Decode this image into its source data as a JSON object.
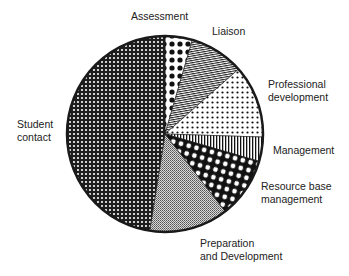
{
  "chart_data": {
    "type": "pie",
    "title": "",
    "start_angle_deg": 0,
    "direction": "clockwise",
    "categories": [
      "Assessment",
      "Liaison",
      "Professional development",
      "Management",
      "Resource base management",
      "Preparation and Development",
      "Student contact"
    ],
    "values": [
      4.5,
      9,
      12,
      4,
      10,
      13,
      47.5
    ],
    "unit": "percent (estimated)",
    "slices": [
      {
        "name": "Assessment",
        "value": 4.5,
        "pattern": "large-black-dots-on-white"
      },
      {
        "name": "Liaison",
        "value": 9,
        "pattern": "fine-diagonal-lines"
      },
      {
        "name": "Professional development",
        "value": 12,
        "pattern": "small-black-dots-on-white"
      },
      {
        "name": "Management",
        "value": 4,
        "pattern": "vertical-stripes"
      },
      {
        "name": "Resource base management",
        "value": 10,
        "pattern": "white-dots-on-black"
      },
      {
        "name": "Preparation and Development",
        "value": 13,
        "pattern": "fine-crosshatch-grey"
      },
      {
        "name": "Student contact",
        "value": 47.5,
        "pattern": "dense-checker-dark"
      }
    ],
    "legend": "none (direct labels)",
    "grid": false
  },
  "labels": {
    "assessment": "Assessment",
    "liaison": "Liaison",
    "professional_1": "Professional",
    "professional_2": "development",
    "management": "Management",
    "resource_1": "Resource base",
    "resource_2": "management",
    "preparation_1": "Preparation",
    "preparation_2": "and Development",
    "student_1": "Student",
    "student_2": "contact"
  },
  "geometry": {
    "cx": 165,
    "cy": 134,
    "r": 98
  }
}
